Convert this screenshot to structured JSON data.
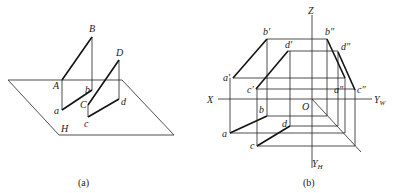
{
  "figure_a": {
    "caption": "(a)",
    "plane_label": "H",
    "points": {
      "A": "A",
      "B": "B",
      "C": "C",
      "D": "D",
      "a": "a",
      "b": "b",
      "c": "c",
      "d": "d"
    }
  },
  "figure_b": {
    "caption": "(b)",
    "axes": {
      "X": "X",
      "Z": "Z",
      "O": "O",
      "YW": "Y",
      "YW_sub": "W",
      "YH": "Y",
      "YH_sub": "H"
    },
    "points": {
      "a": "a",
      "b": "b",
      "c": "c",
      "d": "d",
      "a1": "a'",
      "b1": "b'",
      "c1": "c'",
      "d1": "d'",
      "a2": "a\"",
      "b2": "b\"",
      "c2": "c\"",
      "d2": "d\""
    }
  },
  "colors": {
    "line": "#111111",
    "background": "#ffffff"
  }
}
